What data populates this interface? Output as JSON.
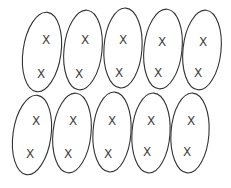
{
  "diagram": {
    "mark_glyph": "X",
    "stroke_color": "#333333",
    "groups": [
      {
        "cx": 42,
        "cy": 52,
        "rx": 19,
        "ry": 40,
        "rot": 8,
        "marks": [
          {
            "x": 46,
            "y": 40
          },
          {
            "x": 41,
            "y": 74
          }
        ]
      },
      {
        "cx": 83,
        "cy": 50,
        "rx": 19,
        "ry": 40,
        "rot": 6,
        "marks": [
          {
            "x": 85,
            "y": 40
          },
          {
            "x": 79,
            "y": 74
          }
        ]
      },
      {
        "cx": 123,
        "cy": 48,
        "rx": 19,
        "ry": 40,
        "rot": 4,
        "marks": [
          {
            "x": 123,
            "y": 40
          },
          {
            "x": 119,
            "y": 73
          }
        ]
      },
      {
        "cx": 163,
        "cy": 49,
        "rx": 19,
        "ry": 40,
        "rot": 6,
        "marks": [
          {
            "x": 162,
            "y": 42
          },
          {
            "x": 158,
            "y": 73
          }
        ]
      },
      {
        "cx": 202,
        "cy": 50,
        "rx": 19,
        "ry": 40,
        "rot": 6,
        "marks": [
          {
            "x": 203,
            "y": 42
          },
          {
            "x": 198,
            "y": 73
          }
        ]
      },
      {
        "cx": 32,
        "cy": 135,
        "rx": 19,
        "ry": 40,
        "rot": 8,
        "marks": [
          {
            "x": 36,
            "y": 121
          },
          {
            "x": 30,
            "y": 154
          }
        ]
      },
      {
        "cx": 72,
        "cy": 133,
        "rx": 19,
        "ry": 40,
        "rot": 6,
        "marks": [
          {
            "x": 73,
            "y": 121
          },
          {
            "x": 68,
            "y": 154
          }
        ]
      },
      {
        "cx": 112,
        "cy": 132,
        "rx": 19,
        "ry": 40,
        "rot": 4,
        "marks": [
          {
            "x": 112,
            "y": 121
          },
          {
            "x": 108,
            "y": 154
          }
        ]
      },
      {
        "cx": 151,
        "cy": 133,
        "rx": 19,
        "ry": 40,
        "rot": 4,
        "marks": [
          {
            "x": 151,
            "y": 121
          },
          {
            "x": 147,
            "y": 152
          }
        ]
      },
      {
        "cx": 190,
        "cy": 133,
        "rx": 19,
        "ry": 40,
        "rot": 4,
        "marks": [
          {
            "x": 191,
            "y": 121
          },
          {
            "x": 187,
            "y": 152
          }
        ]
      }
    ]
  }
}
